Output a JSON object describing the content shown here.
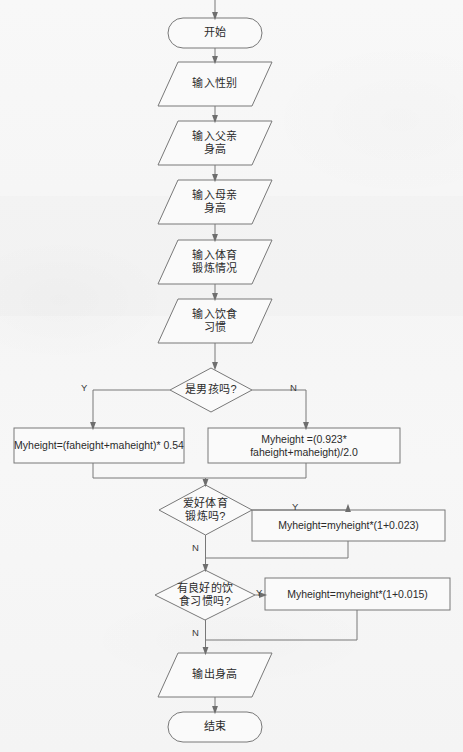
{
  "diagram": {
    "type": "flowchart",
    "background_color": "#f6f6f6",
    "stroke_color": "#707070",
    "text_color": "#2b2b2b",
    "nodes": [
      {
        "id": "start",
        "shape": "terminator",
        "label": "开始",
        "x": 168,
        "y": 18,
        "w": 94,
        "h": 30
      },
      {
        "id": "in_gender",
        "shape": "parallelogram",
        "label": "输入性别",
        "x": 158,
        "y": 62,
        "w": 114,
        "h": 44
      },
      {
        "id": "in_father",
        "shape": "parallelogram",
        "label": "输入父亲\n身高",
        "x": 158,
        "y": 121,
        "w": 114,
        "h": 44
      },
      {
        "id": "in_mother",
        "shape": "parallelogram",
        "label": "输入母亲\n身高",
        "x": 158,
        "y": 180,
        "w": 114,
        "h": 44
      },
      {
        "id": "in_sport",
        "shape": "parallelogram",
        "label": "输入体育\n锻炼情况",
        "x": 158,
        "y": 240,
        "w": 114,
        "h": 44
      },
      {
        "id": "in_diet",
        "shape": "parallelogram",
        "label": "输入饮食\n习惯",
        "x": 158,
        "y": 299,
        "w": 114,
        "h": 44
      },
      {
        "id": "q_boy",
        "shape": "diamond",
        "label": "是男孩吗?",
        "x": 170,
        "y": 368,
        "w": 82,
        "h": 44
      },
      {
        "id": "calc_boy",
        "shape": "process",
        "label": "Myheight=(faheight+maheight)*  0.54",
        "x": 14,
        "y": 428,
        "w": 170,
        "h": 35
      },
      {
        "id": "calc_girl",
        "shape": "process",
        "label": "Myheight =(0.923*  faheight+maheight)/2.0",
        "x": 208,
        "y": 428,
        "w": 192,
        "h": 35
      },
      {
        "id": "q_sport",
        "shape": "diamond",
        "label": "爱好体育\n锻炼吗?",
        "x": 159,
        "y": 485,
        "w": 93,
        "h": 50
      },
      {
        "id": "calc_sport",
        "shape": "process",
        "label": "Myheight=myheight*(1+0.023)",
        "x": 252,
        "y": 510,
        "w": 193,
        "h": 31
      },
      {
        "id": "q_diet",
        "shape": "diamond",
        "label": "有良好的饮\n食习惯吗?",
        "x": 155,
        "y": 570,
        "w": 100,
        "h": 50
      },
      {
        "id": "calc_diet",
        "shape": "process",
        "label": "Myheight=myheight*(1+0.015)",
        "x": 265,
        "y": 578,
        "w": 185,
        "h": 32
      },
      {
        "id": "out_height",
        "shape": "parallelogram",
        "label": "输出身高",
        "x": 158,
        "y": 653,
        "w": 114,
        "h": 44
      },
      {
        "id": "end",
        "shape": "terminator",
        "label": "结束",
        "x": 168,
        "y": 712,
        "w": 94,
        "h": 30
      }
    ],
    "edge_labels": [
      {
        "id": "boy-yes",
        "text": "Y",
        "x": 81,
        "y": 382
      },
      {
        "id": "boy-no",
        "text": "N",
        "x": 290,
        "y": 382
      },
      {
        "id": "sport-yes",
        "text": "Y",
        "x": 327,
        "y": 497
      },
      {
        "id": "sport-no",
        "text": "N",
        "x": 192,
        "y": 543
      },
      {
        "id": "diet-yes",
        "text": "Y",
        "x": 264,
        "y": 587
      },
      {
        "id": "diet-no",
        "text": "N",
        "x": 192,
        "y": 629
      }
    ]
  }
}
